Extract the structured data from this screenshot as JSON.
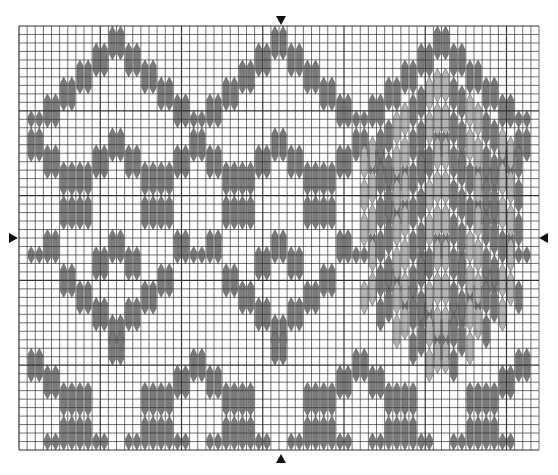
{
  "chart": {
    "columns": 64,
    "rows": 50,
    "center": {
      "column": 32,
      "row": 25
    },
    "colors": {
      "grid_line": "#333333",
      "grid_background": "#ffffff",
      "dark_stitch": "#7a7a7a",
      "light_stitch": "#b4b4b4",
      "marker": "#111111"
    },
    "motif_peaks": [
      11,
      31,
      51
    ],
    "filled_motif_peak": 51,
    "outline_steps": [
      {
        "dx": 0,
        "row": 0,
        "len": 4
      },
      {
        "dx": 2,
        "row": 2,
        "len": 4
      },
      {
        "dx": 4,
        "row": 4,
        "len": 4
      },
      {
        "dx": 6,
        "row": 6,
        "len": 4
      },
      {
        "dx": 8,
        "row": 8,
        "len": 4
      },
      {
        "dx": 10,
        "row": 10,
        "len": 2
      }
    ],
    "inner_steps": [
      {
        "dx": 0,
        "row": 12,
        "len": 4
      },
      {
        "dx": 2,
        "row": 14,
        "len": 4
      },
      {
        "dx": 4,
        "row": 16,
        "len": 4
      },
      {
        "dx": 4,
        "row": 20,
        "len": 4
      },
      {
        "dx": 6,
        "row": 16,
        "len": 4
      },
      {
        "dx": 6,
        "row": 20,
        "len": 4
      },
      {
        "dx": 8,
        "row": 14,
        "len": 4
      },
      {
        "dx": 10,
        "row": 12,
        "len": 4
      },
      {
        "dx": 8,
        "row": 24,
        "len": 4
      },
      {
        "dx": 10,
        "row": 26,
        "len": 2
      },
      {
        "dx": 0,
        "row": 24,
        "len": 4
      },
      {
        "dx": 2,
        "row": 26,
        "len": 4
      },
      {
        "dx": 6,
        "row": 28,
        "len": 4
      },
      {
        "dx": 4,
        "row": 30,
        "len": 4
      },
      {
        "dx": 2,
        "row": 32,
        "len": 4
      },
      {
        "dx": 0,
        "row": 34,
        "len": 4
      }
    ],
    "bottom_steps": [
      {
        "dx": 10,
        "row": 38,
        "len": 4
      },
      {
        "dx": 8,
        "row": 40,
        "len": 4
      },
      {
        "dx": 4,
        "row": 42,
        "len": 4
      },
      {
        "dx": 6,
        "row": 42,
        "len": 4
      },
      {
        "dx": 4,
        "row": 46,
        "len": 4
      },
      {
        "dx": 6,
        "row": 46,
        "len": 4
      },
      {
        "dx": 2,
        "row": 48,
        "len": 2
      },
      {
        "dx": 8,
        "row": 48,
        "len": 2
      },
      {
        "dx": 0,
        "row": 36,
        "len": 4
      }
    ],
    "markers": [
      "top",
      "bottom",
      "left",
      "right"
    ]
  }
}
